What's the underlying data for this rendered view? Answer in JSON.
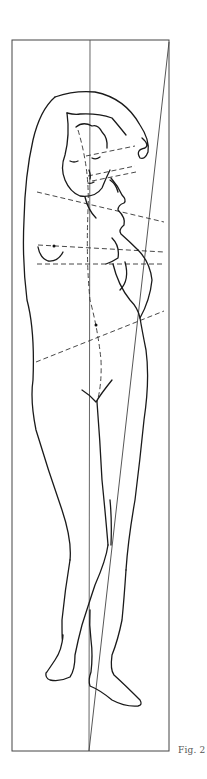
{
  "figure": {
    "caption": "Fig. 2"
  },
  "colors": {
    "line": "#1a1a1a",
    "frame": "#444444",
    "background": "#ffffff"
  }
}
